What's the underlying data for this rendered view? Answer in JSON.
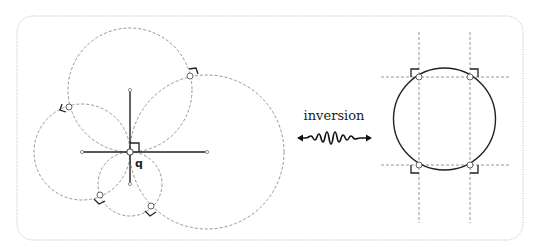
{
  "diagram": {
    "point_label": "q",
    "arrow_label": "inversion",
    "colors": {
      "frame": "#bdbdbd",
      "dashed": "#8a8a8a",
      "solid": "#222222",
      "point_fill": "#ffffff",
      "point_stroke": "#555555"
    },
    "left_panel": {
      "center_q": [
        130,
        152
      ],
      "cross_lines": [
        {
          "from": [
            82,
            152
          ],
          "to": [
            207,
            152
          ]
        },
        {
          "from": [
            130,
            90
          ],
          "to": [
            130,
            184
          ]
        }
      ],
      "circles": [
        {
          "name": "top",
          "cx": 130,
          "cy": 90,
          "r": 62
        },
        {
          "name": "right",
          "cx": 207,
          "cy": 152,
          "r": 77
        },
        {
          "name": "left",
          "cx": 82,
          "cy": 152,
          "r": 48
        },
        {
          "name": "bottom",
          "cx": 130,
          "cy": 184,
          "r": 32
        }
      ],
      "intersections": [
        [
          69,
          107
        ],
        [
          190,
          76
        ],
        [
          100,
          195
        ],
        [
          150,
          207
        ]
      ]
    },
    "right_panel": {
      "circle": {
        "cx": 444,
        "cy": 120,
        "r": 51
      },
      "vertical_lines_x": [
        419,
        470
      ],
      "horizontal_lines_y": [
        77,
        165
      ],
      "intersections": [
        [
          419,
          77
        ],
        [
          470,
          77
        ],
        [
          419,
          165
        ],
        [
          470,
          165
        ]
      ]
    }
  }
}
